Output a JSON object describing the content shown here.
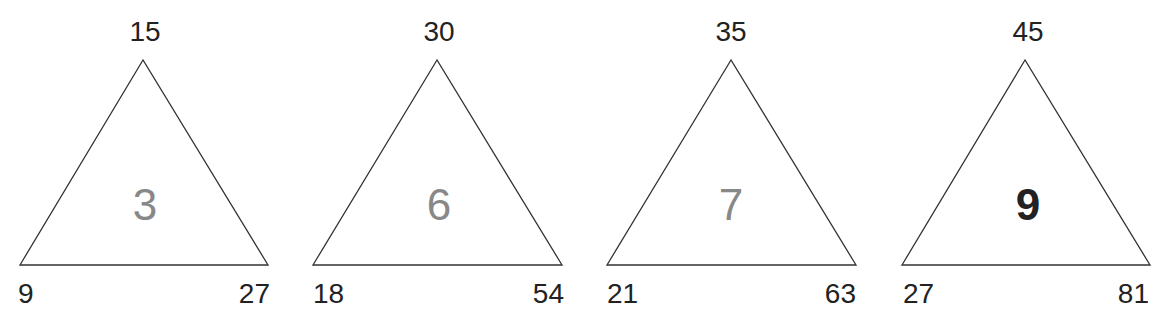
{
  "puzzles": [
    {
      "top": "15",
      "left": "9",
      "right": "27",
      "center": "3",
      "center_color": "#888888",
      "bold": false
    },
    {
      "top": "30",
      "left": "18",
      "right": "54",
      "center": "6",
      "center_color": "#888888",
      "bold": false
    },
    {
      "top": "35",
      "left": "21",
      "right": "63",
      "center": "7",
      "center_color": "#888888",
      "bold": false
    },
    {
      "top": "45",
      "left": "27",
      "right": "81",
      "center": "9",
      "center_color": "#222222",
      "bold": true
    }
  ],
  "colors": {
    "line": "#333333",
    "text": "#222222",
    "muted": "#888888"
  }
}
